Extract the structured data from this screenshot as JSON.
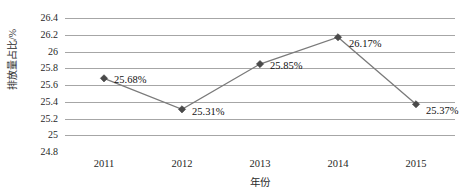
{
  "chart_data": {
    "type": "line",
    "title": "",
    "xlabel": "年份",
    "ylabel": "排放量占比/%",
    "categories": [
      "2011",
      "2012",
      "2013",
      "2014",
      "2015"
    ],
    "values": [
      25.68,
      25.31,
      25.85,
      26.17,
      25.37
    ],
    "point_labels": [
      "25.68%",
      "25.31%",
      "25.85%",
      "26.17%",
      "25.37%"
    ],
    "ylim": [
      24.8,
      26.4
    ],
    "ytick_step": 0.2,
    "ytick_labels": [
      "26.4",
      "26.2",
      "26",
      "25.8",
      "25.6",
      "25.4",
      "25.2",
      "25",
      "24.8"
    ],
    "ytick_values": [
      26.4,
      26.2,
      26,
      25.8,
      25.6,
      25.4,
      25.2,
      25,
      24.8
    ],
    "grid": "horizontal",
    "legend": "none",
    "series": [
      {
        "name": "排放量占比",
        "values": [
          25.68,
          25.31,
          25.85,
          26.17,
          25.37
        ],
        "marker": "diamond",
        "line_color": "#7a7a7a",
        "marker_color": "#4a4a4a"
      }
    ],
    "colors": {
      "background": "#ffffff",
      "gridline": "#a6a6a6",
      "axis": "#8c8c8c",
      "text": "#1f1f1f"
    }
  }
}
